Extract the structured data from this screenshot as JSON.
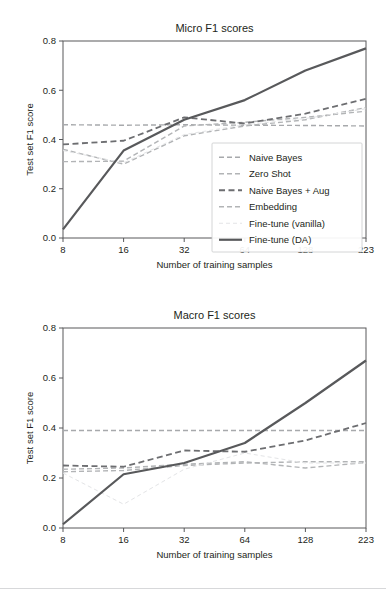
{
  "figure": {
    "name": "micro-macro-f1-line-charts",
    "width": 386,
    "height": 598
  },
  "axis": {
    "xlabel": "Number of training samples",
    "ylabel": "Test set F1 score",
    "xticks": [
      "8",
      "16",
      "32",
      "64",
      "128",
      "223"
    ],
    "yticks": [
      "0.0",
      "0.2",
      "0.4",
      "0.6",
      "0.8"
    ]
  },
  "legend": {
    "position": "lower-right-inside-top-panel",
    "items": [
      {
        "label": "Naive Bayes",
        "color": "#a7a9ac",
        "dash": "5,3",
        "width": 1.4
      },
      {
        "label": "Zero Shot",
        "color": "#b2b4b6",
        "dash": "5,3",
        "width": 1.4
      },
      {
        "label": "Naive Bayes + Aug",
        "color": "#6d6e71",
        "dash": "6,3.5",
        "width": 1.8
      },
      {
        "label": "Embedding",
        "color": "#b2b4b6",
        "dash": "5,3",
        "width": 1.4
      },
      {
        "label": "Fine-tune (vanilla)",
        "color": "#e3e4e6",
        "dash": "4,3",
        "width": 1.0
      },
      {
        "label": "Fine-tune (DA)",
        "color": "#58595b",
        "dash": "none",
        "width": 2.2
      }
    ]
  },
  "chart_data": [
    {
      "type": "line",
      "title": "Micro F1 scores",
      "xlabel": "Number of training samples",
      "ylabel": "Test set F1 score",
      "categories": [
        "8",
        "16",
        "32",
        "64",
        "128",
        "223"
      ],
      "ylim": [
        0.0,
        0.8
      ],
      "yticks": [
        0.0,
        0.2,
        0.4,
        0.6,
        0.8
      ],
      "grid": false,
      "legend": "lower right",
      "series": [
        {
          "name": "Naive Bayes",
          "values": [
            0.46,
            0.458,
            0.46,
            0.458,
            0.457,
            0.455
          ]
        },
        {
          "name": "Zero Shot",
          "values": [
            0.31,
            0.312,
            0.455,
            0.47,
            0.49,
            0.515
          ]
        },
        {
          "name": "Naive Bayes + Aug",
          "values": [
            0.38,
            0.395,
            0.49,
            0.465,
            0.505,
            0.565
          ]
        },
        {
          "name": "Embedding",
          "values": [
            0.36,
            0.3,
            0.415,
            0.455,
            0.48,
            0.53
          ]
        },
        {
          "name": "Fine-tune (vanilla)",
          "values": [
            0.355,
            0.305,
            0.42,
            0.46,
            0.485,
            0.525
          ]
        },
        {
          "name": "Fine-tune (DA)",
          "values": [
            0.035,
            0.355,
            0.48,
            0.56,
            0.68,
            0.77
          ]
        }
      ]
    },
    {
      "type": "line",
      "title": "Macro F1 scores",
      "xlabel": "Number of training samples",
      "ylabel": "Test set F1 score",
      "categories": [
        "8",
        "16",
        "32",
        "64",
        "128",
        "223"
      ],
      "ylim": [
        0.0,
        0.8
      ],
      "yticks": [
        0.0,
        0.2,
        0.4,
        0.6,
        0.8
      ],
      "grid": false,
      "legend": "none",
      "series": [
        {
          "name": "Naive Bayes",
          "values": [
            0.39,
            0.39,
            0.39,
            0.39,
            0.39,
            0.39
          ]
        },
        {
          "name": "Zero Shot",
          "values": [
            0.235,
            0.24,
            0.255,
            0.265,
            0.24,
            0.262
          ]
        },
        {
          "name": "Naive Bayes + Aug",
          "values": [
            0.25,
            0.245,
            0.31,
            0.305,
            0.35,
            0.42
          ]
        },
        {
          "name": "Embedding",
          "values": [
            0.225,
            0.23,
            0.25,
            0.26,
            0.265,
            0.265
          ]
        },
        {
          "name": "Fine-tune (vanilla)",
          "values": [
            0.22,
            0.095,
            0.235,
            0.3,
            0.26,
            0.26
          ]
        },
        {
          "name": "Fine-tune (DA)",
          "values": [
            0.015,
            0.215,
            0.26,
            0.34,
            0.5,
            0.67
          ]
        }
      ]
    }
  ]
}
